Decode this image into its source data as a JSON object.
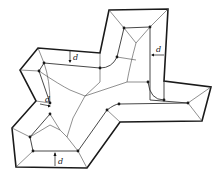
{
  "diagram": {
    "offset_label": "d",
    "offset_annotations": [
      {
        "id": "top-left-arm",
        "label": "d",
        "direction": "down"
      },
      {
        "id": "top-right-arm",
        "label": "d",
        "direction": "left"
      },
      {
        "id": "left-notch",
        "label": "d",
        "direction": "right"
      },
      {
        "id": "bottom",
        "label": "d",
        "direction": "up"
      }
    ],
    "colors": {
      "outer_stroke": "#1a1a1a",
      "inner_stroke": "#333333",
      "skeleton_stroke": "#444444",
      "background": "#ffffff"
    }
  }
}
